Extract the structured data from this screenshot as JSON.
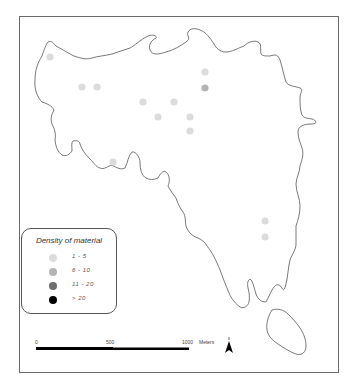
{
  "map": {
    "frame": {
      "x": 19,
      "y": 16,
      "width": 320,
      "height": 357,
      "border_color": "#6a6a6a"
    },
    "outline_color": "#555555",
    "legend": {
      "title": "Density of material",
      "classes": [
        {
          "label": "1 - 5",
          "color": "#dcdcdc"
        },
        {
          "label": "6 - 10",
          "color": "#b4b4b4"
        },
        {
          "label": "11 - 20",
          "color": "#6e6e6e"
        },
        {
          "label": "> 20",
          "color": "#000000"
        }
      ]
    },
    "points": [
      {
        "x": 50,
        "y": 57,
        "class": "1 - 5"
      },
      {
        "x": 82,
        "y": 87,
        "class": "1 - 5"
      },
      {
        "x": 97,
        "y": 87,
        "class": "1 - 5"
      },
      {
        "x": 143,
        "y": 102,
        "class": "1 - 5"
      },
      {
        "x": 174,
        "y": 102,
        "class": "1 - 5"
      },
      {
        "x": 158,
        "y": 117,
        "class": "1 - 5"
      },
      {
        "x": 190,
        "y": 117,
        "class": "1 - 5"
      },
      {
        "x": 190,
        "y": 131,
        "class": "1 - 5"
      },
      {
        "x": 205,
        "y": 72,
        "class": "1 - 5"
      },
      {
        "x": 205,
        "y": 88,
        "class": "6 - 10"
      },
      {
        "x": 113,
        "y": 162,
        "class": "1 - 5"
      },
      {
        "x": 265,
        "y": 221,
        "class": "1 - 5"
      },
      {
        "x": 265,
        "y": 237,
        "class": "1 - 5"
      }
    ],
    "scale_bar": {
      "ticks": [
        "0",
        "500",
        "1000"
      ],
      "unit": "Meters"
    },
    "north_arrow": {
      "label": "N"
    }
  }
}
